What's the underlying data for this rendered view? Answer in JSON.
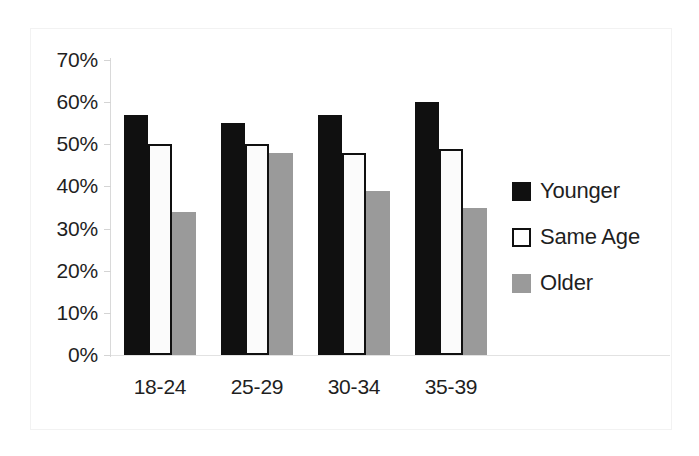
{
  "chart_data": {
    "type": "bar",
    "title": "",
    "subtitle": "",
    "xlabel": "",
    "ylabel": "",
    "categories": [
      "18-24",
      "25-29",
      "30-34",
      "35-39"
    ],
    "series": [
      {
        "name": "Younger",
        "values": [
          57,
          55,
          57,
          60
        ],
        "color": "#101010"
      },
      {
        "name": "Same Age",
        "values": [
          50,
          50,
          48,
          49
        ],
        "color": "#ffffff"
      },
      {
        "name": "Older",
        "values": [
          34,
          48,
          39,
          35
        ],
        "color": "#9a9a9a"
      }
    ],
    "ylim": [
      0,
      70
    ],
    "ytick_values": [
      70,
      60,
      50,
      40,
      30,
      20,
      10,
      0
    ],
    "ytick_labels": [
      "70%",
      "60%",
      "50%",
      "40%",
      "30%",
      "20%",
      "10%",
      "0%"
    ],
    "grid": false,
    "legend_position": "right",
    "value_unit": "%"
  },
  "legend": {
    "items": [
      {
        "label": "Younger",
        "swatch": "filled-black-square-icon"
      },
      {
        "label": "Same Age",
        "swatch": "outlined-white-square-icon"
      },
      {
        "label": "Older",
        "swatch": "filled-gray-square-icon"
      }
    ]
  },
  "axis": {
    "y_labels": [
      "70%",
      "60%",
      "50%",
      "40%",
      "30%",
      "20%",
      "10%",
      "0%"
    ],
    "x_labels": [
      "18-24",
      "25-29",
      "30-34",
      "35-39"
    ]
  },
  "colors": {
    "younger": "#101010",
    "same_age": "#ffffff",
    "older": "#9a9a9a",
    "axis": "#d9d9d9",
    "frame": "#f2f2f2",
    "text": "#1f1f1f"
  }
}
